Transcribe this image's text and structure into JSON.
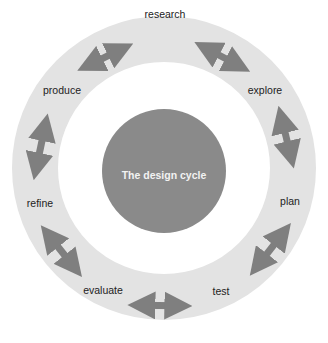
{
  "title": "The design cycle",
  "stages": [
    {
      "label": "research",
      "x": 165,
      "y": 14
    },
    {
      "label": "explore",
      "x": 265,
      "y": 90
    },
    {
      "label": "plan",
      "x": 290,
      "y": 201
    },
    {
      "label": "test",
      "x": 221,
      "y": 291
    },
    {
      "label": "evaluate",
      "x": 103,
      "y": 290
    },
    {
      "label": "refine",
      "x": 40,
      "y": 203
    },
    {
      "label": "produce",
      "x": 62,
      "y": 90
    }
  ],
  "colors": {
    "ring": "#e3e3e3",
    "center": "#8a8a8a",
    "arrow": "#7f7f7f",
    "label_text": "#222222",
    "center_text": "#f2f2f2"
  },
  "arrows": [
    {
      "name": "produce-research",
      "x1": 83,
      "y1": 68,
      "x2": 130,
      "y2": 45
    },
    {
      "name": "research-explore",
      "x1": 200,
      "y1": 45,
      "x2": 247,
      "y2": 70
    },
    {
      "name": "explore-plan",
      "x1": 280,
      "y1": 112,
      "x2": 293,
      "y2": 165
    },
    {
      "name": "plan-test",
      "x1": 287,
      "y1": 228,
      "x2": 252,
      "y2": 273
    },
    {
      "name": "test-evaluate",
      "x1": 186,
      "y1": 306,
      "x2": 131,
      "y2": 305
    },
    {
      "name": "evaluate-refine",
      "x1": 78,
      "y1": 272,
      "x2": 43,
      "y2": 228
    },
    {
      "name": "refine-produce",
      "x1": 35,
      "y1": 174,
      "x2": 47,
      "y2": 117
    }
  ]
}
